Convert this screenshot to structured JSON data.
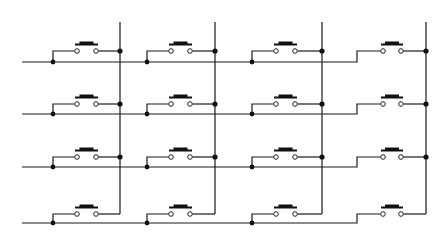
{
  "diagram": {
    "width": 446,
    "height": 242,
    "colors": {
      "wire": "#1a1a1a",
      "background": "#ffffff"
    },
    "columns": [
      {
        "x": 120,
        "y_top": 22,
        "y_bottom": 214
      },
      {
        "x": 215,
        "y_top": 22,
        "y_bottom": 214
      },
      {
        "x": 322,
        "y_top": 22,
        "y_bottom": 214
      },
      {
        "x": 426,
        "y_top": 22,
        "y_bottom": 214
      }
    ],
    "rows": [
      {
        "y": 62,
        "contact_y": 51
      },
      {
        "y": 114,
        "contact_y": 104
      },
      {
        "y": 167,
        "contact_y": 157
      },
      {
        "y": 223,
        "contact_y": 214
      }
    ],
    "row_line": {
      "x_start": 22,
      "step_x": 357
    },
    "cells": [
      {
        "left_x": 53,
        "contact_l": 77,
        "contact_r": 96
      },
      {
        "left_x": 147,
        "contact_l": 171,
        "contact_r": 190
      },
      {
        "left_x": 252,
        "contact_l": 276,
        "contact_r": 295
      },
      {
        "left_x": 357,
        "contact_l": 383,
        "contact_r": 401
      }
    ],
    "switch_count": 16
  }
}
